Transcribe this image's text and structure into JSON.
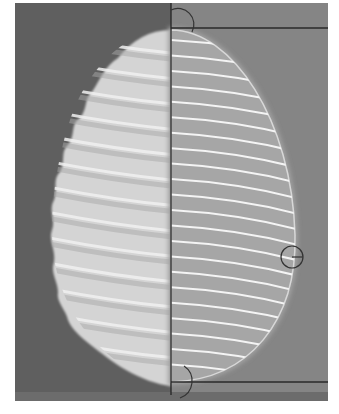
{
  "figure": {
    "colors": {
      "frame_left_bg": "#5f5f5f",
      "frame_right_bg": "#858585",
      "specimen_fill": "#d6d6d6",
      "model_fill": "#a9a9a9",
      "ridge_color": "#f4f4f4",
      "measure_line": "#2a2a2a"
    },
    "ridge_count_left": 13,
    "ridge_count_right": 22,
    "markers": [
      "top-apex-marker",
      "equator-marker",
      "bottom-apex-marker"
    ],
    "measure_lines": [
      "axis-line",
      "top-tangent-line",
      "bottom-tangent-line"
    ]
  }
}
